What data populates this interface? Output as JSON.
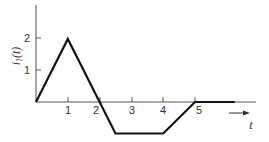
{
  "chart_data": {
    "type": "line",
    "title": "",
    "xlabel": "t",
    "ylabel": "i1(t)",
    "ylabel_main": "i",
    "ylabel_sub": "1",
    "ylabel_arg": "(t)",
    "x_ticks": [
      "1",
      "2",
      "3",
      "4",
      "5"
    ],
    "y_ticks": [
      "1",
      "2"
    ],
    "xlim": [
      0,
      6.8
    ],
    "ylim": [
      -1.1,
      3.1
    ],
    "grid": false,
    "legend": null,
    "series": [
      {
        "name": "i1(t)",
        "x": [
          0,
          1,
          2.5,
          4,
          5,
          6.25
        ],
        "y": [
          0,
          2,
          -1,
          -1,
          0,
          0
        ]
      }
    ],
    "annotations": [
      {
        "text": "t",
        "description": "arrow pointing right under time axis"
      }
    ],
    "colors": {
      "line": "#111111",
      "axis": "#555555",
      "text": "#333333"
    }
  }
}
